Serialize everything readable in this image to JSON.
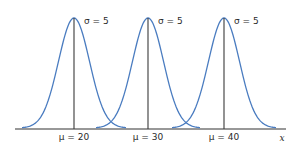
{
  "chart_data": {
    "type": "line",
    "title": "",
    "xlabel": "x",
    "ylabel": "",
    "series": [
      {
        "name": "Normal(μ=20, σ=5)",
        "mean": 20,
        "sigma": 5,
        "mean_label": "μ = 20",
        "sigma_label": "σ = 5"
      },
      {
        "name": "Normal(μ=30, σ=5)",
        "mean": 30,
        "sigma": 5,
        "mean_label": "μ = 30",
        "sigma_label": "σ = 5"
      },
      {
        "name": "Normal(μ=40, σ=5)",
        "mean": 40,
        "sigma": 5,
        "mean_label": "μ = 40",
        "sigma_label": "σ = 5"
      }
    ],
    "x_tick_labels": [
      "μ = 20",
      "μ = 30",
      "μ = 40"
    ],
    "grid": false,
    "legend": "none"
  },
  "labels": {
    "sigma1": "σ = 5",
    "sigma2": "σ = 5",
    "sigma3": "σ = 5",
    "mu1": "μ = 20",
    "mu2": "μ = 30",
    "mu3": "μ = 40",
    "axis_x": "x"
  },
  "colors": {
    "curve": "#4a7cc0",
    "axis": "#333333",
    "mean_line": "#3a3a3a"
  }
}
